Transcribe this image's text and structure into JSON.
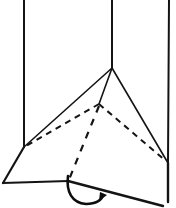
{
  "figure": {
    "title": "Folded triangular prism with rotation arrow",
    "kind": "line-drawing",
    "background_color": "#ffffff",
    "stroke_color": "#141414",
    "canvas": {
      "width": 176,
      "height": 208
    },
    "vertices": {
      "wall_top_left": {
        "label": "A",
        "x": 24,
        "y": 0
      },
      "wall_top_mid": {
        "label": "B",
        "x": 112,
        "y": 0
      },
      "wall_top_right": {
        "label": "C",
        "x": 169,
        "y": 0
      },
      "apex": {
        "label": "D",
        "x": 112,
        "y": 68
      },
      "interior": {
        "label": "E",
        "x": 99,
        "y": 104
      },
      "left": {
        "label": "F",
        "x": 24,
        "y": 147
      },
      "right": {
        "label": "G",
        "x": 168,
        "y": 163
      },
      "base_left": {
        "label": "H",
        "x": 3,
        "y": 183
      },
      "base_mid": {
        "label": "I",
        "x": 68,
        "y": 182
      },
      "base_right": {
        "label": "J",
        "x": 162,
        "y": 206
      },
      "base_right_edge": {
        "label": "K",
        "x": 168,
        "y": 200
      }
    },
    "edges_solid": [
      {
        "name": "wall-edge-left",
        "from": "wall_top_left",
        "to": "left",
        "width": 2.0
      },
      {
        "name": "wall-edge-mid",
        "from": "wall_top_mid",
        "to": "apex",
        "width": 2.0
      },
      {
        "name": "wall-edge-right",
        "from": "wall_top_right",
        "to": "right",
        "width": 2.0
      },
      {
        "name": "apex-to-left",
        "from": "apex",
        "to": "left",
        "width": 1.6
      },
      {
        "name": "apex-to-right",
        "from": "apex",
        "to": "right",
        "width": 1.6
      },
      {
        "name": "apex-to-interior",
        "from": "apex",
        "to": "interior",
        "width": 1.6
      },
      {
        "name": "left-to-base-left",
        "from": "left",
        "to": "base_left",
        "width": 2.2
      },
      {
        "name": "base-left-to-base-mid",
        "from": "base_left",
        "to": "base_mid",
        "width": 2.2
      },
      {
        "name": "base-mid-to-base-right",
        "from": "base_mid",
        "to": "base_right",
        "width": 2.4
      },
      {
        "name": "right-to-base-right-edge",
        "from": "right",
        "to": "base_right_edge",
        "width": 2.4
      }
    ],
    "edges_dashed": [
      {
        "name": "hidden-interior-to-left",
        "from": "interior",
        "to": "left",
        "width": 2.0,
        "dash": "6 5"
      },
      {
        "name": "hidden-interior-to-right",
        "from": "interior",
        "to": "right",
        "width": 2.0,
        "dash": "6 5"
      },
      {
        "name": "hidden-interior-to-base",
        "from": "interior",
        "to": "base_mid",
        "width": 2.2,
        "dash": "7 7"
      }
    ],
    "arrow": {
      "name": "rotation-arrow",
      "description": "curved counter-clockwise fold arrow below base",
      "start": {
        "x": 68,
        "y": 177
      },
      "end": {
        "x": 100,
        "y": 199
      },
      "width": 2.6,
      "head_size": 8,
      "direction": "counter-clockwise"
    }
  }
}
